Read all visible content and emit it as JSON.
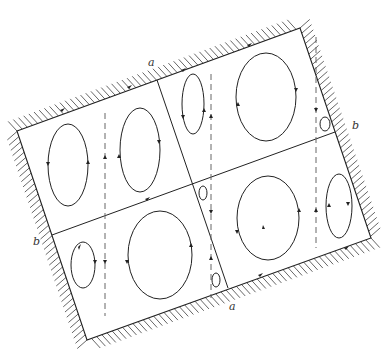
{
  "diagram": {
    "type": "vortex flow cells in rotated rectangular container with hatched walls",
    "labels": {
      "a_top": "a",
      "a_bottom": "a",
      "b_left": "b",
      "b_right": "b"
    },
    "container_corners": [
      [
        17,
        131
      ],
      [
        300,
        28
      ],
      [
        371,
        238
      ],
      [
        87,
        340
      ]
    ],
    "divider_a": [
      [
        157,
        80
      ],
      [
        228,
        288
      ]
    ],
    "divider_b": [
      [
        52,
        235
      ],
      [
        335,
        132
      ]
    ],
    "dashed_lines_x": [
      105,
      211,
      316
    ],
    "vortices": [
      {
        "cx": 68,
        "cy": 165,
        "rx": 20,
        "ry": 41
      },
      {
        "cx": 140,
        "cy": 150,
        "rx": 20,
        "ry": 42
      },
      {
        "cx": 193,
        "cy": 104,
        "rx": 11,
        "ry": 30
      },
      {
        "cx": 266,
        "cy": 97,
        "rx": 30,
        "ry": 44
      },
      {
        "cx": 325,
        "cy": 124,
        "rx": 5,
        "ry": 7
      },
      {
        "cx": 83,
        "cy": 265,
        "rx": 12,
        "ry": 23
      },
      {
        "cx": 160,
        "cy": 255,
        "rx": 32,
        "ry": 44
      },
      {
        "cx": 203,
        "cy": 193,
        "rx": 4,
        "ry": 7
      },
      {
        "cx": 268,
        "cy": 218,
        "rx": 31,
        "ry": 42
      },
      {
        "cx": 339,
        "cy": 206,
        "rx": 13,
        "ry": 32
      },
      {
        "cx": 216,
        "cy": 280,
        "rx": 4,
        "ry": 7
      }
    ]
  }
}
